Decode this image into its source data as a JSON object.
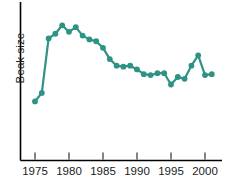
{
  "chart_data": {
    "type": "line",
    "title": "",
    "xlabel": "",
    "ylabel": "Beak size",
    "xlim": [
      1974,
      2002
    ],
    "ylim": [
      0,
      1
    ],
    "grid": false,
    "legend": null,
    "series_color": "#2E9384",
    "xticks": [
      1975,
      1980,
      1985,
      1990,
      1995,
      2000
    ],
    "xticklabels": [
      "1975",
      "1980",
      "1985",
      "1990",
      "1995",
      "2000"
    ],
    "yticks": [],
    "yticklabels": [],
    "x": [
      1975,
      1976,
      1977,
      1978,
      1979,
      1980,
      1981,
      1982,
      1983,
      1984,
      1985,
      1986,
      1987,
      1988,
      1989,
      1990,
      1991,
      1992,
      1993,
      1994,
      1995,
      1996,
      1997,
      1998,
      1999,
      2000,
      2001
    ],
    "values": [
      0.07,
      0.16,
      0.74,
      0.79,
      0.88,
      0.81,
      0.86,
      0.77,
      0.73,
      0.71,
      0.64,
      0.52,
      0.45,
      0.44,
      0.45,
      0.41,
      0.36,
      0.35,
      0.37,
      0.37,
      0.25,
      0.33,
      0.31,
      0.45,
      0.56,
      0.35,
      0.36
    ],
    "series_name": "Beak size"
  },
  "axis": {
    "y_label": "Beak size"
  }
}
